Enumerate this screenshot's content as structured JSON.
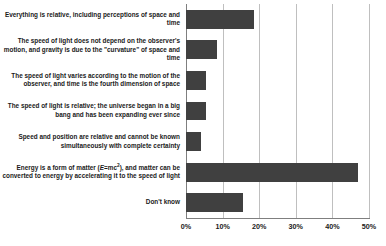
{
  "chart_data": {
    "type": "bar",
    "orientation": "horizontal",
    "title": "",
    "xlabel": "",
    "ylabel": "",
    "xlim": [
      0,
      50
    ],
    "xtick_labels": [
      "0%",
      "10%",
      "20%",
      "30%",
      "40%",
      "50%"
    ],
    "xticks": [
      0,
      10,
      20,
      30,
      40,
      50
    ],
    "grid": true,
    "legend": "none",
    "bar_color": "#404040",
    "categories": [
      "Everything is relative, including perceptions of space and time",
      "The speed of light does not depend on the observer's motion, and gravity is due to the \"curvature\" of space and time",
      "The speed of light varies according to the motion of the observer, and time is the fourth dimension of space",
      "The speed of light is relative; the universe began in a big bang and has been expanding ever since",
      "Speed and position are relative and cannot be known simultaneously with complete certainty",
      "Energy is a form of matter (E=mc²), and matter can be converted to energy by accelerating it to the speed of light",
      "Don't know"
    ],
    "values": [
      18.5,
      8.5,
      5.5,
      5.5,
      4.0,
      47.0,
      15.5
    ]
  }
}
